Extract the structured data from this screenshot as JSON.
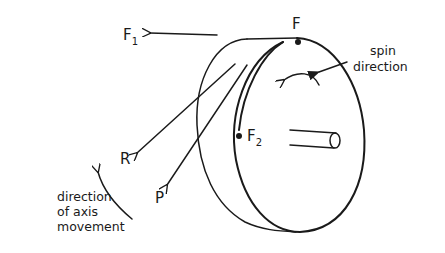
{
  "diagram": {
    "labels": {
      "F1_main": "F",
      "F1_sub": "1",
      "F": "F",
      "F2_main": "F",
      "F2_sub": "2",
      "R": "R",
      "P": "P",
      "spin_line1": "spin",
      "spin_line2": "direction",
      "axis_line1": "direction",
      "axis_line2": "of axis",
      "axis_line3": "movement"
    },
    "colors": {
      "ink": "#1a1a1a",
      "background": "#ffffff"
    }
  }
}
